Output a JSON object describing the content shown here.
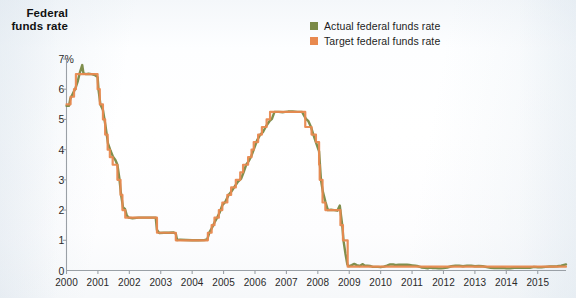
{
  "title": {
    "line1": "Federal",
    "line2": "funds rate"
  },
  "legend": {
    "items": [
      {
        "label": "Actual federal funds rate",
        "color": "#7b8a47",
        "swatch": "legend-swatch-actual"
      },
      {
        "label": "Target federal funds rate",
        "color": "#e8894f",
        "swatch": "legend-swatch-target"
      }
    ]
  },
  "axes": {
    "y_ticks": [
      "7%",
      "6",
      "5",
      "4",
      "3",
      "2",
      "1",
      "0"
    ],
    "x_ticks": [
      "2000",
      "2001",
      "2002",
      "2003",
      "2004",
      "2005",
      "2006",
      "2007",
      "2008",
      "2009",
      "2010",
      "2011",
      "2012",
      "2013",
      "2014",
      "2015"
    ]
  },
  "chart_data": {
    "type": "line",
    "title": "Federal funds rate",
    "xlabel": "",
    "ylabel": "Federal funds rate",
    "ylim": [
      0,
      7
    ],
    "xlim": [
      2000,
      2015.9
    ],
    "grid": false,
    "legend_position": "top-right",
    "ytick_labels": [
      "0",
      "1",
      "2",
      "3",
      "4",
      "5",
      "6",
      "7%"
    ],
    "ytick_values": [
      0,
      1,
      2,
      3,
      4,
      5,
      6,
      7
    ],
    "xtick_values": [
      2000,
      2001,
      2002,
      2003,
      2004,
      2005,
      2006,
      2007,
      2008,
      2009,
      2010,
      2011,
      2012,
      2013,
      2014,
      2015
    ],
    "note": "Step series; target is a policy step function, actual is the effective rate which tracks it closely with small deviations.",
    "series": [
      {
        "name": "Actual federal funds rate",
        "color": "#7b8a47",
        "points": [
          [
            2000.0,
            5.45
          ],
          [
            2000.08,
            5.45
          ],
          [
            2000.12,
            5.68
          ],
          [
            2000.2,
            5.85
          ],
          [
            2000.28,
            6.02
          ],
          [
            2000.36,
            6.27
          ],
          [
            2000.42,
            6.53
          ],
          [
            2000.5,
            6.8
          ],
          [
            2000.54,
            6.52
          ],
          [
            2000.62,
            6.5
          ],
          [
            2000.7,
            6.51
          ],
          [
            2000.8,
            6.5
          ],
          [
            2000.9,
            6.47
          ],
          [
            2000.99,
            6.4
          ],
          [
            2001.02,
            5.98
          ],
          [
            2001.08,
            5.49
          ],
          [
            2001.16,
            5.31
          ],
          [
            2001.24,
            4.8
          ],
          [
            2001.32,
            4.21
          ],
          [
            2001.4,
            3.97
          ],
          [
            2001.48,
            3.77
          ],
          [
            2001.56,
            3.65
          ],
          [
            2001.62,
            3.5
          ],
          [
            2001.68,
            3.07
          ],
          [
            2001.74,
            2.49
          ],
          [
            2001.8,
            2.09
          ],
          [
            2001.86,
            2.04
          ],
          [
            2001.92,
            1.82
          ],
          [
            2001.98,
            1.75
          ],
          [
            2002.1,
            1.73
          ],
          [
            2002.3,
            1.75
          ],
          [
            2002.5,
            1.75
          ],
          [
            2002.7,
            1.75
          ],
          [
            2002.84,
            1.75
          ],
          [
            2002.88,
            1.34
          ],
          [
            2002.95,
            1.24
          ],
          [
            2003.1,
            1.25
          ],
          [
            2003.25,
            1.25
          ],
          [
            2003.4,
            1.26
          ],
          [
            2003.48,
            1.22
          ],
          [
            2003.52,
            1.01
          ],
          [
            2003.62,
            1.02
          ],
          [
            2003.8,
            1.01
          ],
          [
            2004.0,
            1.0
          ],
          [
            2004.2,
            1.0
          ],
          [
            2004.4,
            1.01
          ],
          [
            2004.48,
            1.03
          ],
          [
            2004.55,
            1.26
          ],
          [
            2004.64,
            1.43
          ],
          [
            2004.72,
            1.61
          ],
          [
            2004.8,
            1.76
          ],
          [
            2004.88,
            1.93
          ],
          [
            2004.96,
            2.16
          ],
          [
            2005.06,
            2.28
          ],
          [
            2005.16,
            2.5
          ],
          [
            2005.26,
            2.63
          ],
          [
            2005.36,
            2.79
          ],
          [
            2005.46,
            2.94
          ],
          [
            2005.56,
            3.04
          ],
          [
            2005.64,
            3.26
          ],
          [
            2005.72,
            3.5
          ],
          [
            2005.8,
            3.62
          ],
          [
            2005.88,
            3.78
          ],
          [
            2005.96,
            4.0
          ],
          [
            2006.06,
            4.29
          ],
          [
            2006.16,
            4.49
          ],
          [
            2006.26,
            4.59
          ],
          [
            2006.36,
            4.79
          ],
          [
            2006.46,
            4.94
          ],
          [
            2006.54,
            5.02
          ],
          [
            2006.62,
            5.25
          ],
          [
            2006.75,
            5.25
          ],
          [
            2006.9,
            5.24
          ],
          [
            2007.05,
            5.26
          ],
          [
            2007.2,
            5.26
          ],
          [
            2007.35,
            5.25
          ],
          [
            2007.5,
            5.25
          ],
          [
            2007.62,
            5.02
          ],
          [
            2007.7,
            4.94
          ],
          [
            2007.78,
            4.76
          ],
          [
            2007.86,
            4.49
          ],
          [
            2007.94,
            4.24
          ],
          [
            2008.04,
            3.94
          ],
          [
            2008.1,
            3.0
          ],
          [
            2008.16,
            2.61
          ],
          [
            2008.24,
            2.28
          ],
          [
            2008.32,
            2.0
          ],
          [
            2008.42,
            2.01
          ],
          [
            2008.52,
            2.0
          ],
          [
            2008.62,
            1.98
          ],
          [
            2008.7,
            2.15
          ],
          [
            2008.74,
            1.81
          ],
          [
            2008.78,
            1.48
          ],
          [
            2008.82,
            0.97
          ],
          [
            2008.88,
            0.55
          ],
          [
            2008.94,
            0.2
          ],
          [
            2008.99,
            0.14
          ],
          [
            2009.08,
            0.18
          ],
          [
            2009.16,
            0.22
          ],
          [
            2009.24,
            0.18
          ],
          [
            2009.33,
            0.15
          ],
          [
            2009.42,
            0.21
          ],
          [
            2009.5,
            0.16
          ],
          [
            2009.58,
            0.16
          ],
          [
            2009.66,
            0.15
          ],
          [
            2009.75,
            0.12
          ],
          [
            2009.83,
            0.12
          ],
          [
            2009.92,
            0.12
          ],
          [
            2010.0,
            0.11
          ],
          [
            2010.1,
            0.13
          ],
          [
            2010.2,
            0.16
          ],
          [
            2010.3,
            0.2
          ],
          [
            2010.4,
            0.2
          ],
          [
            2010.5,
            0.18
          ],
          [
            2010.58,
            0.19
          ],
          [
            2010.66,
            0.19
          ],
          [
            2010.75,
            0.19
          ],
          [
            2010.84,
            0.19
          ],
          [
            2010.92,
            0.18
          ],
          [
            2011.0,
            0.17
          ],
          [
            2011.1,
            0.16
          ],
          [
            2011.2,
            0.14
          ],
          [
            2011.3,
            0.1
          ],
          [
            2011.4,
            0.09
          ],
          [
            2011.5,
            0.07
          ],
          [
            2011.58,
            0.1
          ],
          [
            2011.66,
            0.08
          ],
          [
            2011.75,
            0.08
          ],
          [
            2011.84,
            0.07
          ],
          [
            2011.92,
            0.07
          ],
          [
            2012.0,
            0.08
          ],
          [
            2012.12,
            0.1
          ],
          [
            2012.25,
            0.14
          ],
          [
            2012.38,
            0.16
          ],
          [
            2012.5,
            0.16
          ],
          [
            2012.62,
            0.14
          ],
          [
            2012.75,
            0.16
          ],
          [
            2012.88,
            0.16
          ],
          [
            2013.0,
            0.14
          ],
          [
            2013.12,
            0.15
          ],
          [
            2013.25,
            0.14
          ],
          [
            2013.38,
            0.11
          ],
          [
            2013.5,
            0.09
          ],
          [
            2013.62,
            0.08
          ],
          [
            2013.75,
            0.08
          ],
          [
            2013.88,
            0.09
          ],
          [
            2014.0,
            0.07
          ],
          [
            2014.12,
            0.07
          ],
          [
            2014.25,
            0.09
          ],
          [
            2014.38,
            0.1
          ],
          [
            2014.5,
            0.09
          ],
          [
            2014.62,
            0.09
          ],
          [
            2014.75,
            0.09
          ],
          [
            2014.88,
            0.12
          ],
          [
            2015.0,
            0.11
          ],
          [
            2015.12,
            0.11
          ],
          [
            2015.25,
            0.12
          ],
          [
            2015.38,
            0.13
          ],
          [
            2015.5,
            0.13
          ],
          [
            2015.62,
            0.14
          ],
          [
            2015.75,
            0.16
          ],
          [
            2015.9,
            0.2
          ]
        ]
      },
      {
        "name": "Target federal funds rate",
        "color": "#e8894f",
        "points": [
          [
            2000.0,
            5.5
          ],
          [
            2000.13,
            5.5
          ],
          [
            2000.13,
            5.75
          ],
          [
            2000.24,
            5.75
          ],
          [
            2000.24,
            6.0
          ],
          [
            2000.3,
            6.0
          ],
          [
            2000.3,
            6.5
          ],
          [
            2000.99,
            6.5
          ],
          [
            2000.99,
            6.0
          ],
          [
            2001.06,
            6.0
          ],
          [
            2001.06,
            5.5
          ],
          [
            2001.16,
            5.5
          ],
          [
            2001.16,
            5.0
          ],
          [
            2001.23,
            5.0
          ],
          [
            2001.23,
            4.5
          ],
          [
            2001.31,
            4.5
          ],
          [
            2001.31,
            4.0
          ],
          [
            2001.38,
            4.0
          ],
          [
            2001.38,
            3.75
          ],
          [
            2001.47,
            3.75
          ],
          [
            2001.47,
            3.5
          ],
          [
            2001.62,
            3.5
          ],
          [
            2001.62,
            3.0
          ],
          [
            2001.72,
            3.0
          ],
          [
            2001.72,
            2.5
          ],
          [
            2001.78,
            2.5
          ],
          [
            2001.78,
            2.0
          ],
          [
            2001.87,
            2.0
          ],
          [
            2001.87,
            1.75
          ],
          [
            2002.88,
            1.75
          ],
          [
            2002.88,
            1.25
          ],
          [
            2003.48,
            1.25
          ],
          [
            2003.48,
            1.0
          ],
          [
            2004.5,
            1.0
          ],
          [
            2004.5,
            1.25
          ],
          [
            2004.62,
            1.25
          ],
          [
            2004.62,
            1.5
          ],
          [
            2004.71,
            1.5
          ],
          [
            2004.71,
            1.75
          ],
          [
            2004.85,
            1.75
          ],
          [
            2004.85,
            2.0
          ],
          [
            2004.96,
            2.0
          ],
          [
            2004.96,
            2.25
          ],
          [
            2005.12,
            2.25
          ],
          [
            2005.12,
            2.5
          ],
          [
            2005.24,
            2.5
          ],
          [
            2005.24,
            2.75
          ],
          [
            2005.39,
            2.75
          ],
          [
            2005.39,
            3.0
          ],
          [
            2005.53,
            3.0
          ],
          [
            2005.53,
            3.25
          ],
          [
            2005.62,
            3.25
          ],
          [
            2005.62,
            3.5
          ],
          [
            2005.78,
            3.5
          ],
          [
            2005.78,
            3.75
          ],
          [
            2005.89,
            3.75
          ],
          [
            2005.89,
            4.0
          ],
          [
            2005.96,
            4.0
          ],
          [
            2005.96,
            4.25
          ],
          [
            2006.1,
            4.25
          ],
          [
            2006.1,
            4.5
          ],
          [
            2006.22,
            4.5
          ],
          [
            2006.22,
            4.75
          ],
          [
            2006.37,
            4.75
          ],
          [
            2006.37,
            5.0
          ],
          [
            2006.48,
            5.0
          ],
          [
            2006.48,
            5.25
          ],
          [
            2007.6,
            5.25
          ],
          [
            2007.6,
            4.75
          ],
          [
            2007.8,
            4.75
          ],
          [
            2007.8,
            4.5
          ],
          [
            2007.94,
            4.5
          ],
          [
            2007.94,
            4.25
          ],
          [
            2008.04,
            4.25
          ],
          [
            2008.04,
            3.5
          ],
          [
            2008.06,
            3.5
          ],
          [
            2008.06,
            3.0
          ],
          [
            2008.15,
            3.0
          ],
          [
            2008.15,
            2.25
          ],
          [
            2008.24,
            2.25
          ],
          [
            2008.24,
            2.0
          ],
          [
            2008.72,
            2.0
          ],
          [
            2008.72,
            1.5
          ],
          [
            2008.8,
            1.5
          ],
          [
            2008.8,
            1.0
          ],
          [
            2008.95,
            1.0
          ],
          [
            2008.95,
            0.125
          ],
          [
            2015.9,
            0.125
          ]
        ]
      }
    ]
  }
}
